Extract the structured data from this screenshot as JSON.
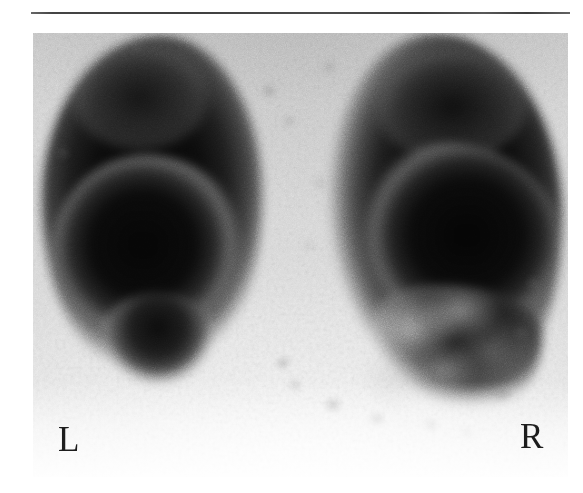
{
  "figure": {
    "kind": "nuclear-medicine-scintigraphy-scan",
    "modality_note": "planar posterior perfusion scintigram",
    "separator_rule": "",
    "labels": {
      "left": "L",
      "right": "R"
    },
    "regions": [
      {
        "name": "left-organ-uptake",
        "side": "L",
        "description": "dense homogeneous tracer uptake"
      },
      {
        "name": "right-organ-uptake",
        "side": "R",
        "description": "dense uptake with patchy inferior defects"
      },
      {
        "name": "midline-background",
        "description": "low-count central background"
      }
    ],
    "colors": {
      "film_background": "#d7d7d7",
      "hot_uptake": "#0a0a0a",
      "label_text": "#1d1d1d",
      "rule": "#343434",
      "page": "#ffffff"
    }
  }
}
